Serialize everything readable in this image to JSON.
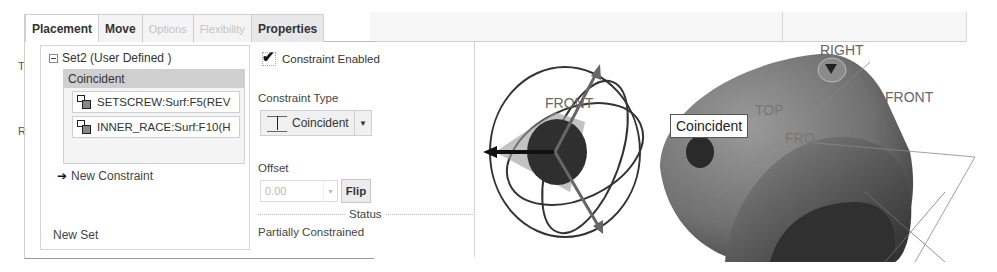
{
  "tabs": [
    {
      "label": "Placement",
      "state": "active"
    },
    {
      "label": "Move",
      "state": "normal"
    },
    {
      "label": "Options",
      "state": "disabled"
    },
    {
      "label": "Flexibility",
      "state": "disabled"
    },
    {
      "label": "Properties",
      "state": "normal"
    }
  ],
  "placement": {
    "set_header": "Set2 (User Defined )",
    "constraint_title": "Coincident",
    "references": [
      {
        "label": "SETSCREW:Surf:F5(REV",
        "icon": "surface-ref-icon"
      },
      {
        "label": "INNER_RACE:Surf:F10(H",
        "icon": "surface-ref-icon"
      }
    ],
    "new_constraint": "New Constraint",
    "new_set": "New Set"
  },
  "constraint": {
    "enabled_label": "Constraint Enabled",
    "enabled": true,
    "type_label": "Constraint Type",
    "type_value": "Coincident",
    "offset_label": "Offset",
    "offset_value": "0.00",
    "flip_label": "Flip",
    "status_label": "Status",
    "status_value": "Partially Constrained"
  },
  "viewport": {
    "tooltip": "Coincident",
    "datum_labels": {
      "right": "RIGHT",
      "front_main": "FRONT",
      "front_dragger": "FRONT",
      "top": "TOP",
      "front_faint": "FRO"
    }
  },
  "colors": {
    "panel_border": "#cfcfcf",
    "tab_bg": "#f4f4f4",
    "constraint_header_bg": "#cfcfcf",
    "model_shade": "#7a7a7a"
  }
}
